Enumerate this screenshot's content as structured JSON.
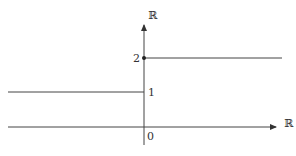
{
  "diagram": {
    "y_axis": {
      "label": "ℝ"
    },
    "x_axis": {
      "label": "ℝ"
    },
    "ticks": {
      "origin": "0",
      "one": "1",
      "two": "2"
    },
    "segments": [
      {
        "name": "left-segment",
        "domain": "x < 0",
        "value": 1
      },
      {
        "name": "right-segment",
        "domain": "x >= 0",
        "value": 2,
        "closed_endpoint": true
      }
    ],
    "colors": {
      "line": "#444444",
      "text": "#333333",
      "background": "#ffffff"
    }
  }
}
